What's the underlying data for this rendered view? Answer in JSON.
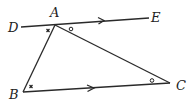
{
  "diagram": {
    "type": "geometry-triangle-with-parallel-line",
    "points": {
      "A": {
        "label": "A",
        "x": 55,
        "y": 25
      },
      "B": {
        "label": "B",
        "x": 23,
        "y": 92
      },
      "C": {
        "label": "C",
        "x": 170,
        "y": 83
      },
      "D": {
        "label": "D",
        "x": 21,
        "y": 27
      },
      "E": {
        "label": "E",
        "x": 149,
        "y": 18
      }
    },
    "segments": [
      {
        "name": "DE",
        "from": "D",
        "to": "E",
        "arrow": "right",
        "parallel_to": "BC"
      },
      {
        "name": "BC",
        "from": "B",
        "to": "C",
        "arrow": "right",
        "parallel_to": "DE"
      },
      {
        "name": "AB",
        "from": "A",
        "to": "B"
      },
      {
        "name": "AC",
        "from": "A",
        "to": "C"
      }
    ],
    "angle_marks": [
      {
        "at": "A",
        "angle": "DAB",
        "mark": "cross"
      },
      {
        "at": "B",
        "angle": "ABC",
        "mark": "cross"
      },
      {
        "at": "A",
        "angle": "EAC",
        "mark": "circle"
      },
      {
        "at": "C",
        "angle": "ACB",
        "mark": "circle"
      }
    ],
    "labels": {
      "A": "A",
      "B": "B",
      "C": "C",
      "D": "D",
      "E": "E"
    }
  }
}
